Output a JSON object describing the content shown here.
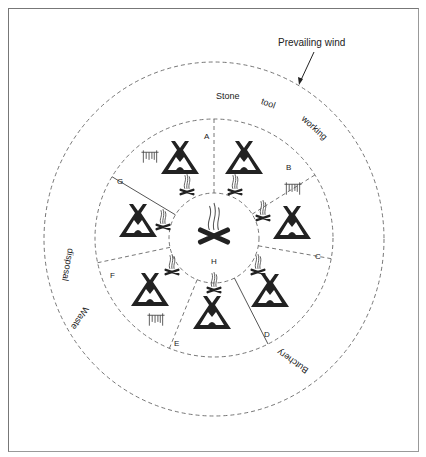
{
  "diagram": {
    "annotation": "Prevailing wind",
    "zones": {
      "outer_top": [
        "Stone",
        "tool",
        "working"
      ],
      "outer_left": [
        "Waste",
        "disposal"
      ],
      "outer_bottom_right": "Butchery"
    },
    "sectors": [
      "A",
      "B",
      "C",
      "D",
      "E",
      "F",
      "G"
    ],
    "centre": {
      "label": "H",
      "icon": "hearth-fire-icon"
    },
    "icons": {
      "tent": "tent-icon",
      "hearth": "hearth-icon",
      "drying_rack": "drying-rack-icon",
      "arrow": "wind-arrow-icon"
    },
    "colors": {
      "ink": "#222222",
      "line": "#666666"
    }
  }
}
